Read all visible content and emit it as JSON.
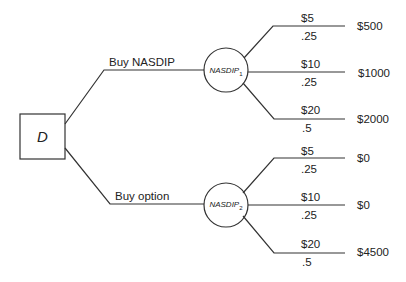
{
  "decision_node": {
    "label": "D"
  },
  "branches": [
    {
      "label": "Buy NASDIP",
      "chance_node": {
        "name": "NASDIP",
        "subscript": "1"
      },
      "outcomes": [
        {
          "value": "$5",
          "prob": ".25",
          "payoff": "$500"
        },
        {
          "value": "$10",
          "prob": ".25",
          "payoff": "$1000"
        },
        {
          "value": "$20",
          "prob": ".5",
          "payoff": "$2000"
        }
      ]
    },
    {
      "label": "Buy option",
      "chance_node": {
        "name": "NASDIP",
        "subscript": "2"
      },
      "outcomes": [
        {
          "value": "$5",
          "prob": ".25",
          "payoff": "$0"
        },
        {
          "value": "$10",
          "prob": ".25",
          "payoff": "$0"
        },
        {
          "value": "$20",
          "prob": ".5",
          "payoff": "$4500"
        }
      ]
    }
  ]
}
